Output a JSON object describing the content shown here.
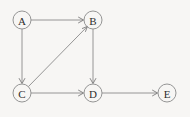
{
  "figure": {
    "kind": "directed-graph",
    "background_color": "#f7f6f4",
    "stroke_color": "#8a8a8a",
    "label_color": "#2e2e2e",
    "width": 190,
    "height": 117
  },
  "nodes": [
    {
      "id": "A",
      "label": "A",
      "cx": 22,
      "cy": 20,
      "r": 9
    },
    {
      "id": "B",
      "label": "B",
      "cx": 93,
      "cy": 20,
      "r": 9
    },
    {
      "id": "C",
      "label": "C",
      "cx": 22,
      "cy": 93,
      "r": 9
    },
    {
      "id": "D",
      "label": "D",
      "cx": 93,
      "cy": 93,
      "r": 9
    },
    {
      "id": "E",
      "label": "E",
      "cx": 167,
      "cy": 93,
      "r": 9
    }
  ],
  "edges": [
    {
      "id": "A-B",
      "from": "A",
      "to": "B",
      "directed": true,
      "label": ""
    },
    {
      "id": "A-C",
      "from": "A",
      "to": "C",
      "directed": true,
      "label": ""
    },
    {
      "id": "C-B",
      "from": "C",
      "to": "B",
      "directed": true,
      "label": ""
    },
    {
      "id": "B-D",
      "from": "B",
      "to": "D",
      "directed": true,
      "label": ""
    },
    {
      "id": "C-D",
      "from": "C",
      "to": "D",
      "directed": true,
      "label": ""
    },
    {
      "id": "D-E",
      "from": "D",
      "to": "E",
      "directed": true,
      "label": ""
    }
  ]
}
